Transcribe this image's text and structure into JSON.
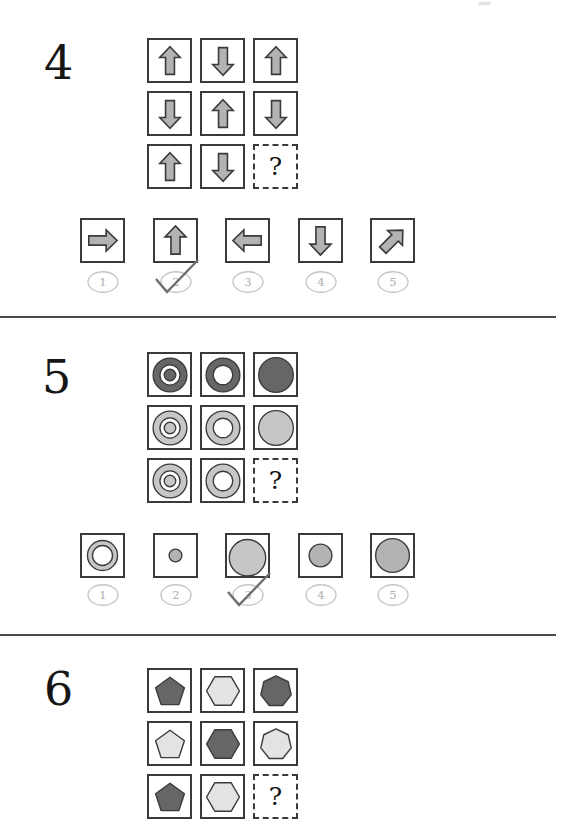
{
  "colors": {
    "dark": "#666666",
    "light": "#c6c6c6",
    "lighter": "#e3e3e3",
    "medium": "#b3b3b3",
    "shape_outline": "#3b3b3b",
    "box_border": "#3a3a3a",
    "badge_stroke": "#c5c5c5",
    "badge_text": "#adadad",
    "check": "#6e6e6e",
    "divider": "#4a4a4a",
    "question_text": "#161616"
  },
  "questions": [
    {
      "number": "4",
      "placeholder": "?",
      "grid": [
        [
          "arrow-up",
          "arrow-down",
          "arrow-up"
        ],
        [
          "arrow-down",
          "arrow-up",
          "arrow-down"
        ],
        [
          "arrow-up",
          "arrow-down",
          "?"
        ]
      ],
      "options": [
        {
          "label": "1",
          "shape": "arrow-right",
          "checked": false
        },
        {
          "label": "2",
          "shape": "arrow-up",
          "checked": true
        },
        {
          "label": "3",
          "shape": "arrow-left",
          "checked": false
        },
        {
          "label": "4",
          "shape": "arrow-down",
          "checked": false
        },
        {
          "label": "5",
          "shape": "arrow-up-right",
          "checked": false
        }
      ]
    },
    {
      "number": "5",
      "placeholder": "?",
      "grid": [
        [
          "bullseye-dark",
          "ring-dark",
          "disc-dark"
        ],
        [
          "bullseye-light",
          "ring-light",
          "disc-light"
        ],
        [
          "bullseye-light",
          "ring-light",
          "?"
        ]
      ],
      "options": [
        {
          "label": "1",
          "shape": "ring-medium",
          "checked": false
        },
        {
          "label": "2",
          "shape": "disc-small",
          "checked": false
        },
        {
          "label": "3",
          "shape": "disc-large-light",
          "checked": true
        },
        {
          "label": "4",
          "shape": "disc-medium",
          "checked": false
        },
        {
          "label": "5",
          "shape": "disc-large",
          "checked": false
        }
      ]
    },
    {
      "number": "6",
      "placeholder": "?",
      "grid": [
        [
          "pentagon-dark",
          "hexagon-light",
          "heptagon-dark"
        ],
        [
          "pentagon-light",
          "hexagon-dark",
          "heptagon-light"
        ],
        [
          "pentagon-dark",
          "hexagon-light",
          "?"
        ]
      ],
      "options": []
    }
  ]
}
